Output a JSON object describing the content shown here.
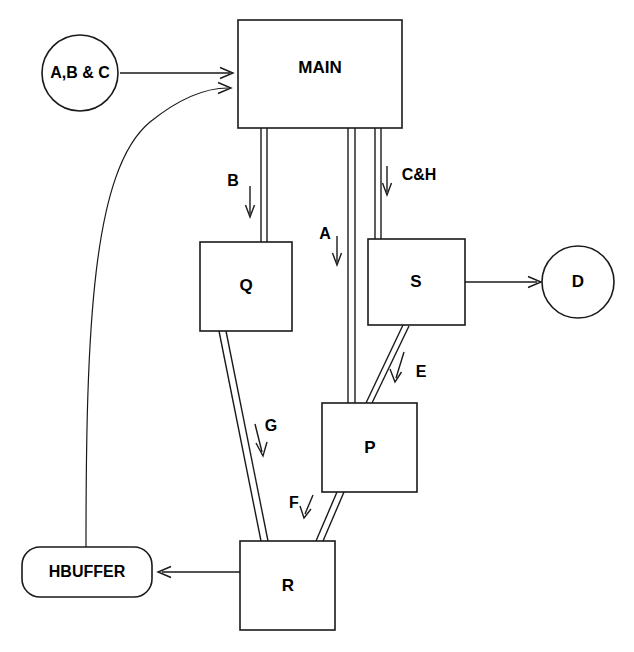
{
  "diagram": {
    "background_color": "#ffffff",
    "line_color": "#1a1a1a",
    "nodes": [
      {
        "id": "abc",
        "label": "A,B & C",
        "shape": "circle",
        "cx": 80,
        "cy": 73,
        "r": 38
      },
      {
        "id": "main",
        "label": "MAIN",
        "shape": "rect",
        "x": 238,
        "y": 20,
        "w": 164,
        "h": 108
      },
      {
        "id": "q",
        "label": "Q",
        "shape": "rect",
        "x": 200,
        "y": 242,
        "w": 92,
        "h": 89
      },
      {
        "id": "s",
        "label": "S",
        "shape": "rect",
        "x": 368,
        "y": 239,
        "w": 97,
        "h": 86
      },
      {
        "id": "d",
        "label": "D",
        "shape": "circle",
        "cx": 578,
        "cy": 282,
        "r": 36
      },
      {
        "id": "p",
        "label": "P",
        "shape": "rect",
        "x": 322,
        "y": 403,
        "w": 95,
        "h": 89
      },
      {
        "id": "r",
        "label": "R",
        "shape": "rect",
        "x": 240,
        "y": 541,
        "w": 95,
        "h": 89
      },
      {
        "id": "hbuffer",
        "label": "HBUFFER",
        "shape": "rounded-rect",
        "x": 22,
        "y": 547,
        "w": 130,
        "h": 50
      }
    ],
    "edges": [
      {
        "id": "abc-main-straight",
        "from": "abc",
        "to": "main",
        "label": "",
        "style": "single-arrow"
      },
      {
        "id": "hbuffer-main-curve",
        "from": "hbuffer",
        "to": "main",
        "label": "",
        "style": "curved-arrow"
      },
      {
        "id": "main-q",
        "from": "main",
        "to": "q",
        "label": "B",
        "style": "double-line"
      },
      {
        "id": "main-p",
        "from": "main",
        "to": "p",
        "label": "A",
        "style": "double-line"
      },
      {
        "id": "main-s",
        "from": "main",
        "to": "s",
        "label": "C&H",
        "style": "double-line"
      },
      {
        "id": "s-d",
        "from": "s",
        "to": "d",
        "label": "",
        "style": "single-arrow"
      },
      {
        "id": "s-p",
        "from": "s",
        "to": "p",
        "label": "E",
        "style": "double-line"
      },
      {
        "id": "q-r",
        "from": "q",
        "to": "r",
        "label": "G",
        "style": "double-line"
      },
      {
        "id": "p-r",
        "from": "p",
        "to": "r",
        "label": "F",
        "style": "double-line"
      },
      {
        "id": "r-hbuffer",
        "from": "r",
        "to": "hbuffer",
        "label": "",
        "style": "single-arrow"
      }
    ],
    "edge_labels": {
      "b": "B",
      "a": "A",
      "ch": "C&H",
      "e": "E",
      "g": "G",
      "f": "F"
    }
  }
}
